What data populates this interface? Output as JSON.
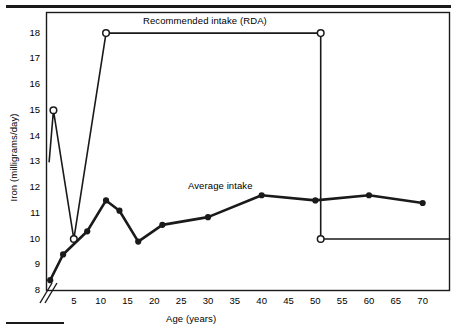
{
  "chart_data": {
    "type": "line",
    "title": "",
    "xlabel": "Age (years)",
    "ylabel": "Iron (milligrams/day)",
    "xlim": [
      0,
      75
    ],
    "ylim": [
      8,
      18.8
    ],
    "grid": false,
    "axis_break": true,
    "xticks": [
      5,
      10,
      15,
      20,
      25,
      30,
      35,
      40,
      45,
      50,
      55,
      60,
      65,
      70
    ],
    "yticks": [
      8,
      9,
      10,
      11,
      12,
      13,
      14,
      15,
      16,
      17,
      18
    ],
    "series": [
      {
        "name": "Recommended intake (RDA)",
        "marker": "open-circle",
        "label_position": "top-center",
        "points": [
          {
            "x": 0.4,
            "y": 13.0
          },
          {
            "x": 1.2,
            "y": 15.0
          },
          {
            "x": 5.0,
            "y": 10.0
          },
          {
            "x": 11.0,
            "y": 18.0
          },
          {
            "x": 51.0,
            "y": 18.0
          },
          {
            "x": 51.0,
            "y": 10.0
          },
          {
            "x": 75.0,
            "y": 10.0
          }
        ]
      },
      {
        "name": "Average intake",
        "marker": "filled-circle",
        "label_position": "above-curve",
        "points": [
          {
            "x": 0.6,
            "y": 8.4
          },
          {
            "x": 3.0,
            "y": 9.4
          },
          {
            "x": 7.5,
            "y": 10.3
          },
          {
            "x": 11.0,
            "y": 11.5
          },
          {
            "x": 13.5,
            "y": 11.1
          },
          {
            "x": 17.0,
            "y": 9.9
          },
          {
            "x": 21.5,
            "y": 10.55
          },
          {
            "x": 30.0,
            "y": 10.85
          },
          {
            "x": 40.0,
            "y": 11.7
          },
          {
            "x": 50.0,
            "y": 11.5
          },
          {
            "x": 60.0,
            "y": 11.7
          },
          {
            "x": 70.0,
            "y": 11.4
          }
        ]
      }
    ]
  },
  "labels": {
    "rda_label": "Recommended intake (RDA)",
    "average_label": "Average intake"
  }
}
